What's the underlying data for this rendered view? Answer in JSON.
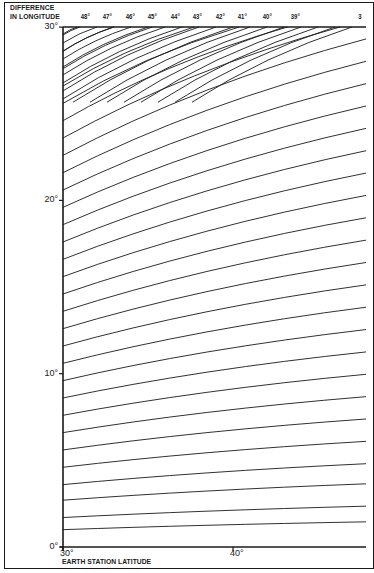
{
  "chart_data": {
    "type": "line",
    "title": "",
    "xlabel": "EARTH STATION LATITUDE",
    "ylabel": "DIFFERENCE\nIN LONGITUDE",
    "ylabel_lines": [
      "DIFFERENCE",
      "IN LONGITUDE"
    ],
    "x_ticks": [
      {
        "label": "30°",
        "value": 30
      },
      {
        "label": "40°",
        "value": 40
      }
    ],
    "y_ticks": [
      {
        "label": "0°",
        "value": 0
      },
      {
        "label": "10°",
        "value": 10
      },
      {
        "label": "20°",
        "value": 20
      },
      {
        "label": "30°",
        "value": 30
      }
    ],
    "xlim": [
      30,
      47.8
    ],
    "ylim": [
      0,
      30
    ],
    "grid": false,
    "top_curve_labels": [
      "48°",
      "47°",
      "46°",
      "45°",
      "44°",
      "43°",
      "42°",
      "41°",
      "40°",
      "39°",
      "3"
    ],
    "curve_family": {
      "description": "Family of curves rising from lower-left to upper-right, converging toward the right",
      "left_axis_starts_deg": [
        1.0,
        1.7,
        2.7,
        3.6,
        4.6,
        5.6,
        6.6,
        7.6,
        8.6,
        9.6,
        10.6,
        11.6,
        12.6,
        13.6,
        14.6,
        15.6,
        16.6,
        17.6,
        18.6,
        19.6,
        20.6,
        21.6,
        22.6,
        23.6,
        24.6,
        25.6,
        26.6,
        27.6,
        28.6,
        29.6
      ],
      "top_axis_starts_lat_deg": [
        31.0,
        32.0,
        33.0,
        34.0,
        35.0,
        36.0,
        37.0,
        38.0,
        39.0,
        40.0,
        41.0,
        42.0,
        43.0,
        44.0,
        45.0,
        46.0,
        47.0
      ]
    }
  },
  "axes": {
    "plot": {
      "left": 63,
      "right": 366,
      "top": 27,
      "bottom": 547
    },
    "x_px_per_deg": 17,
    "y_px_per_deg": 17.33,
    "top_label_x": [
      86,
      108,
      131,
      153,
      176,
      198,
      221,
      243,
      268,
      296,
      364
    ]
  },
  "colors": {
    "ink": "#1a1a1a",
    "background": "#ffffff"
  }
}
